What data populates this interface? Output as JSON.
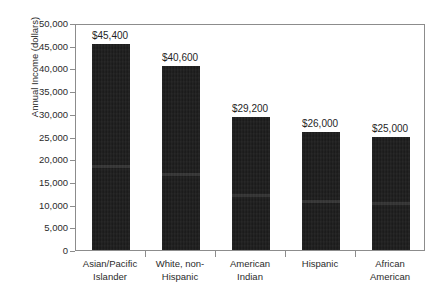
{
  "chart_data": {
    "type": "bar",
    "title": "",
    "subtitle": "",
    "xlabel": "",
    "ylabel": "Annual Income (dollars)",
    "categories": [
      "Asian/Pacific Islander",
      "White, non-Hispanic",
      "American Indian",
      "Hispanic",
      "African American"
    ],
    "category_lines": [
      [
        "Asian/Pacific",
        "Islander"
      ],
      [
        "White, non-",
        "Hispanic"
      ],
      [
        "American",
        "Indian"
      ],
      [
        "Hispanic",
        ""
      ],
      [
        "African",
        "American"
      ]
    ],
    "values": [
      45400,
      40600,
      29200,
      26000,
      25000
    ],
    "data_labels": [
      "$45,400",
      "$40,600",
      "$29,200",
      "$26,000",
      "$25,000"
    ],
    "ylim": [
      0,
      50000
    ],
    "ytick_values": [
      0,
      5000,
      10000,
      15000,
      20000,
      25000,
      30000,
      35000,
      40000,
      45000,
      50000
    ],
    "ytick_labels": [
      "0",
      "5,000",
      "10,000",
      "15,000",
      "20,000",
      "25,000",
      "30,000",
      "35,000",
      "40,000",
      "45,000",
      "50,000"
    ],
    "grid": false,
    "legend": null,
    "bar_color": "#171717",
    "axis_color": "#8c8c8c",
    "text_color": "#2b2b2b",
    "background": "#ffffff"
  }
}
